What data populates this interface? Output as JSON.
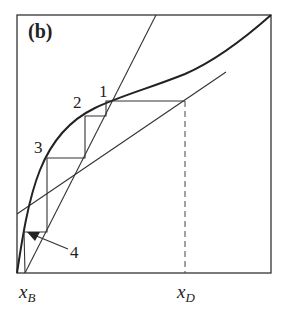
{
  "diagram": {
    "panel_label": "(b)",
    "step_labels": [
      "1",
      "2",
      "3",
      "4"
    ],
    "x_axis_labels": {
      "xB": {
        "main": "x",
        "sub": "B"
      },
      "xD": {
        "main": "x",
        "sub": "D"
      }
    },
    "colors": {
      "line": "#222222",
      "background": "#ffffff"
    },
    "elements": [
      "frame box",
      "equilibrium curve (bold)",
      "steep operating line from x_B",
      "shallow operating line",
      "staircase steps 1-4",
      "dashed vertical at x_D",
      "arrow pointing to step 4"
    ]
  }
}
